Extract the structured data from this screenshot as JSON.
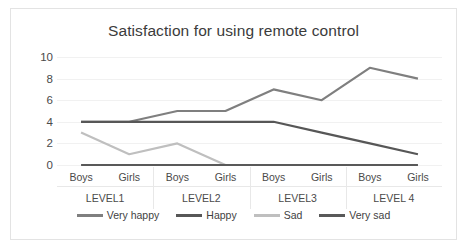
{
  "chart_data": {
    "type": "line",
    "title": "Satisfaction for using remote control",
    "xlabel": "",
    "ylabel": "",
    "ylim": [
      0,
      10
    ],
    "yticks": [
      0,
      2,
      4,
      6,
      8,
      10
    ],
    "grid": true,
    "legend_position": "bottom",
    "groups": [
      {
        "label": "LEVEL1",
        "subcategories": [
          "Boys",
          "Girls"
        ]
      },
      {
        "label": "LEVEL2",
        "subcategories": [
          "Boys",
          "Girls"
        ]
      },
      {
        "label": "LEVEL3",
        "subcategories": [
          "Boys",
          "Girls"
        ]
      },
      {
        "label": "LEVEL 4",
        "subcategories": [
          "Boys",
          "Girls"
        ]
      }
    ],
    "categories": [
      "LEVEL1 Boys",
      "LEVEL1 Girls",
      "LEVEL2 Boys",
      "LEVEL2 Girls",
      "LEVEL3 Boys",
      "LEVEL3 Girls",
      "LEVEL 4 Boys",
      "LEVEL 4 Girls"
    ],
    "series": [
      {
        "name": "Very happy",
        "color": "#7f7f7f",
        "values": [
          4,
          4,
          5,
          5,
          7,
          6,
          9,
          8
        ]
      },
      {
        "name": "Happy",
        "color": "#575757",
        "values": [
          4,
          4,
          4,
          4,
          4,
          3,
          2,
          1
        ]
      },
      {
        "name": "Sad",
        "color": "#bfbfbf",
        "values": [
          3,
          1,
          2,
          0,
          0,
          0,
          0,
          0
        ]
      },
      {
        "name": "Very sad",
        "color": "#595959",
        "values": [
          0,
          0,
          0,
          0,
          0,
          0,
          0,
          0
        ]
      }
    ]
  }
}
